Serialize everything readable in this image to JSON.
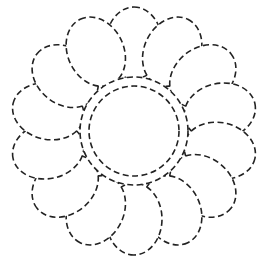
{
  "figure": {
    "stroke_color": "#222222",
    "background": "#ffffff",
    "center": [
      134,
      131
    ],
    "petal_count": 14,
    "petal_ring_radius": 88,
    "petal_rx": 36,
    "petal_ry": 28,
    "outer_circle_radius": 54,
    "inner_circle_radius": 45
  }
}
